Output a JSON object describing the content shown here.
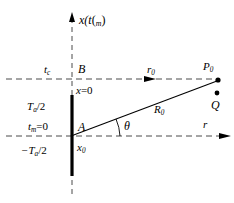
{
  "figure": {
    "type": "geometry-diagram",
    "colors": {
      "ink": "#000000",
      "background": "#ffffff",
      "dashed": "#555555"
    },
    "labels": {
      "x_axis": {
        "text": "x(t",
        "sub": "m",
        "tail": ")"
      },
      "t_c": {
        "text": "t",
        "sub": "c"
      },
      "point_B": {
        "text": "B"
      },
      "x_zero": {
        "base": "x",
        "eq": "=0"
      },
      "Ta_half_pos": {
        "pre": "T",
        "sub": "a",
        "post": "/2"
      },
      "Ta_half_neg": {
        "pre": "−T",
        "sub": "a",
        "post": "/2"
      },
      "t_m_zero": {
        "base": "t",
        "sub": "m",
        "eq": "=0"
      },
      "point_A": {
        "text": "A"
      },
      "x_zero_sub": {
        "base": "x",
        "sub": "0"
      },
      "r_zero": {
        "base": "r",
        "sub": "0"
      },
      "R_zero": {
        "base": "R",
        "sub": "0"
      },
      "point_P0": {
        "base": "P",
        "sub": "0"
      },
      "point_Q": {
        "text": "Q"
      },
      "theta": {
        "text": "θ"
      },
      "r_axis": {
        "text": "r"
      }
    },
    "geometry": {
      "vertical_dashed_x": 72,
      "upper_dashed_y": 79,
      "lower_dashed_y": 136,
      "aperture_top_y": 95,
      "aperture_bottom_y": 176,
      "point_A": [
        72,
        136
      ],
      "point_B": [
        72,
        79
      ],
      "point_P0": [
        218,
        80
      ],
      "point_Q": [
        217,
        93
      ],
      "theta_arc_radius": 48
    }
  }
}
